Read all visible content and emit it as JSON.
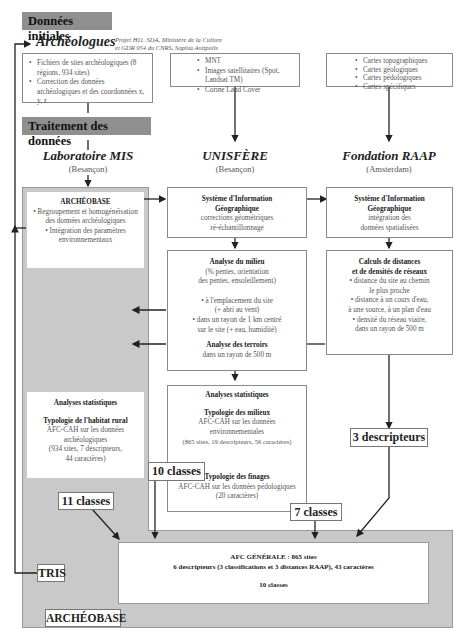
{
  "headers": {
    "initial_data": "Données initiales",
    "processing": "Traitement des données"
  },
  "sources": {
    "archeologues": {
      "title": "Archéologues",
      "credit_line1": "Projet H11. SDA, Ministère de la Culture",
      "credit_line2": "et GDR 954 du CNRS, Sophia Antipolis",
      "items": [
        "Fichiers de sites archéologiques (8 régions, 934 sites)",
        "Correction des données archéologiques et des coordonnées x, y, z"
      ]
    },
    "imagery": {
      "items": [
        "MNT",
        "Images satellitaires (Spot, Landsat TM)",
        "Corine Land Cover"
      ]
    },
    "maps": {
      "items": [
        "Cartes topographiques",
        "Cartes géologiques",
        "Cartes pédologiques",
        "Cartes spécifiques"
      ]
    }
  },
  "labs": [
    {
      "name": "Laboratoire MIS",
      "city": "(Besançon)"
    },
    {
      "name": "UNISFÈRE",
      "city": "(Besançon)"
    },
    {
      "name": "Fondation RAAP",
      "city": "(Amsterdam)"
    }
  ],
  "archeobase_box": {
    "title": "ARCHÉOBASE",
    "items": [
      "Regroupement et homogénéisation des données archéologiques",
      "Intégration des paramètres environnementaux"
    ]
  },
  "sig_unisfere": {
    "title_line1": "Système d'Information",
    "title_line2": "Géographique",
    "line1": "corrections géométriques",
    "line2": "ré-échantillonnage"
  },
  "sig_raap": {
    "title_line1": "Système d'Information",
    "title_line2": "Géographique",
    "line1": "intégration des",
    "line2": "données spatialisées"
  },
  "analyse_milieu": {
    "title": "Analyse du milieu",
    "sub1": "(% pentes, orientation",
    "sub2": "des pentes, ensoleillement)",
    "b1_l1": "• à l'emplacement du site",
    "b1_l2": "(+ abri au vent)",
    "b2_l1": "• dans un rayon de 1 km centré",
    "b2_l2": "sur le site (+ eau, humidité)",
    "terroirs_title": "Analyse des terroirs",
    "terroirs_sub": "dans un rayon de 500 m"
  },
  "calculs": {
    "title_line1": "Calculs de distances",
    "title_line2": "et de densités de réseaux",
    "l1": "• distance du site au chemin",
    "l2": "le plus proche",
    "l3": "• distance à un cours d'eau,",
    "l4": "à une source, à un plan d'eau",
    "l5": "• densité du réseau viaire,",
    "l6": "dans un rayon de 500 m"
  },
  "stats_left": {
    "title": "Analyses statistiques",
    "subtitle": "Typologie de l'habitat rural",
    "l1": "AFC-CAH sur les données",
    "l2": "archéologiques",
    "l3": "(934 sites, 7 descripteurs,",
    "l4": "44 caractères)"
  },
  "stats_mid": {
    "title": "Analyses statistiques",
    "sub1": "Typologie des milieux",
    "l1": "AFC-CAH sur les données",
    "l2": "environnementales",
    "l3": "(865 sites, 19 descripteurs, 56 caractères)",
    "sub2": "Typologie des finages",
    "l4": "AFC-CAH sur les données pédologiques",
    "l5": "(20 caractères)"
  },
  "labels": {
    "classes_10": "10 classes",
    "classes_11": "11 classes",
    "classes_7": "7 classes",
    "descripteurs_3": "3 descripteurs",
    "tris": "TRIS",
    "archeobase": "ARCHÉOBASE"
  },
  "afc": {
    "title": "AFC GÉNÉRALE : 865 sites",
    "line": "6 descripteurs (3 classifications et 3 distances RAAP), 43 caractères",
    "result": "10 classes"
  },
  "colors": {
    "header_bg": "#8f8f8f",
    "archeobase_bg": "#c9c9c9",
    "line": "#222222",
    "box_border": "#8a8a8a"
  }
}
